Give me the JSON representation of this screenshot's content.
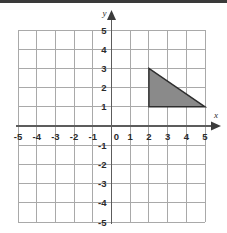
{
  "figure": {
    "kind": "coordinate-plane",
    "background_color": "#ffffff",
    "top_strip_color": "#3a3a3a"
  },
  "axes": {
    "x_label": "x",
    "y_label": "y",
    "origin_label": "0",
    "x_ticks": [
      "-5",
      "-4",
      "-3",
      "-2",
      "-1",
      "1",
      "2",
      "3",
      "4",
      "5"
    ],
    "y_ticks": [
      "5",
      "4",
      "3",
      "2",
      "1",
      "-1",
      "-2",
      "-3",
      "-4",
      "-5"
    ],
    "x_tick_values": [
      -5,
      -4,
      -3,
      -2,
      -1,
      1,
      2,
      3,
      4,
      5
    ],
    "y_tick_values": [
      5,
      4,
      3,
      2,
      1,
      -1,
      -2,
      -3,
      -4,
      -5
    ],
    "axis_color": "#5c5c5c",
    "grid_color": "#a9a9a9",
    "tick_text_color": "#2b2b2b"
  },
  "chart_data": {
    "type": "scatter",
    "title": "",
    "subtitle": "",
    "xlabel": "x",
    "ylabel": "y",
    "xlim": [
      -5,
      5
    ],
    "ylim": [
      -5,
      5
    ],
    "xticks": [
      -5,
      -4,
      -3,
      -2,
      -1,
      0,
      1,
      2,
      3,
      4,
      5
    ],
    "yticks": [
      -5,
      -4,
      -3,
      -2,
      -1,
      0,
      1,
      2,
      3,
      4,
      5
    ],
    "grid": true,
    "grid_spacing": 1,
    "legend": "none",
    "annotations": [],
    "series": [
      {
        "name": "triangle",
        "shape": "polygon",
        "closed": true,
        "vertices": [
          [
            2,
            3
          ],
          [
            5,
            1
          ],
          [
            2,
            1
          ]
        ],
        "vertex_labels": [
          "(2, 3)",
          "(5, 1)",
          "(2, 1)"
        ],
        "fill_color": "#8a8a8a",
        "edge_color": "#2e2e2e",
        "base_length": 3,
        "height_length": 2,
        "area": 3
      }
    ]
  }
}
